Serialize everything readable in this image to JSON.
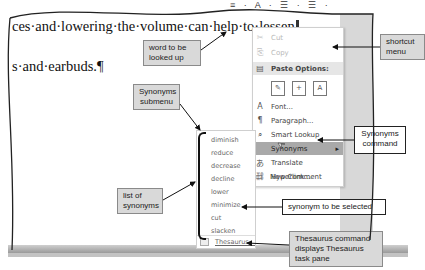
{
  "document": {
    "line1": "ces·and·lowering·the·volume·can·help·to·lessen",
    "line2": "s·and·earbuds.¶"
  },
  "mini_toolbar": {
    "glyphs": "≡ · A · ☰ · ☰ ·"
  },
  "shortcut_menu": {
    "items": [
      {
        "icon": "✂",
        "label": "Cut",
        "state": "disabled"
      },
      {
        "icon": "⎘",
        "label": "Copy",
        "state": "disabled"
      },
      {
        "icon": "📋",
        "label": "Paste Options:",
        "state": "header"
      },
      {
        "icon": "A",
        "label": "Font...",
        "state": "normal"
      },
      {
        "icon": "¶",
        "label": "Paragraph...",
        "state": "normal"
      },
      {
        "icon": "⌕",
        "label": "Smart Lookup",
        "state": "normal"
      },
      {
        "icon": "",
        "label": "Synonyms",
        "state": "highlight",
        "submenu_arrow": "▸"
      },
      {
        "icon": "あ",
        "label": "Translate",
        "state": "normal"
      },
      {
        "icon": "🔗",
        "label": "Hyperlink...",
        "state": "normal"
      },
      {
        "icon": "▭",
        "label": "New Comment",
        "state": "normal"
      }
    ],
    "paste_icons": [
      "keep-source-formatting",
      "merge-formatting",
      "keep-text-only"
    ]
  },
  "synonyms_submenu": {
    "items": [
      "diminish",
      "reduce",
      "decrease",
      "decline",
      "lower",
      "minimize",
      "cut",
      "slacken"
    ],
    "thesaurus_label": "Thesaurus..."
  },
  "callouts": {
    "word_lookup": "word to be looked up",
    "shortcut_menu": "shortcut menu",
    "synonyms_submenu": "Synonyms submenu",
    "synonyms_command": "Synonyms command",
    "list_of_synonyms": "list of synonyms",
    "synonym_selected": "synonym to be selected",
    "thesaurus_command": "Thesaurus command displays Thesaurus task pane"
  }
}
